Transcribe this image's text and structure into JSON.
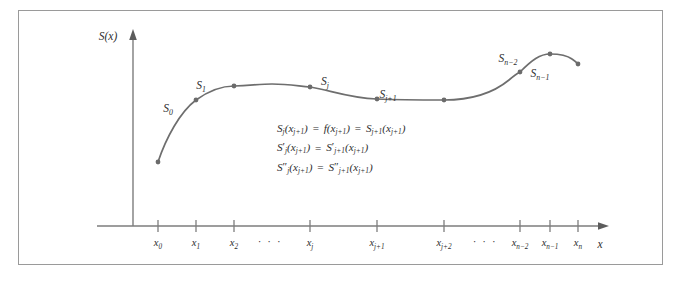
{
  "figure": {
    "kind": "cubic-spline-interpolation-diagram",
    "frame_color": "#9a9a9a",
    "curve_color": "#6e6e6e",
    "axis_color": "#7d7d7d",
    "text_color": "#2e2e2e",
    "background": "#ffffff"
  },
  "axes": {
    "y_label": "S(x)",
    "x_label": "x"
  },
  "x_ticks": [
    {
      "base": "x",
      "sub": "0",
      "x": 158
    },
    {
      "base": "x",
      "sub": "1",
      "x": 196
    },
    {
      "base": "x",
      "sub": "2",
      "x": 234
    },
    {
      "base": "x",
      "sub": "j",
      "x": 310
    },
    {
      "base": "x",
      "sub": "j+1",
      "x": 377
    },
    {
      "base": "x",
      "sub": "j+2",
      "x": 444
    },
    {
      "base": "x",
      "sub": "n−2",
      "x": 520
    },
    {
      "base": "x",
      "sub": "n−1",
      "x": 550
    },
    {
      "base": "x",
      "sub": "n",
      "x": 578
    }
  ],
  "x_ellipses": [
    {
      "text": "· · ·",
      "x": 270
    },
    {
      "text": "· · ·",
      "x": 485
    }
  ],
  "segment_labels": [
    {
      "base": "S",
      "sub": "0",
      "x": 168,
      "y": 112
    },
    {
      "base": "S",
      "sub": "1",
      "x": 201,
      "y": 89
    },
    {
      "base": "S",
      "sub": "j",
      "x": 325,
      "y": 85
    },
    {
      "base": "S",
      "sub": "j+1",
      "x": 388,
      "y": 98
    },
    {
      "base": "S",
      "sub": "n−2",
      "x": 508,
      "y": 62
    },
    {
      "base": "S",
      "sub": "n−1",
      "x": 540,
      "y": 77
    }
  ],
  "equations": [
    {
      "id": "continuity-value",
      "parts": [
        "S",
        "j",
        "(x",
        "j+1",
        ") ",
        "=",
        " f(x",
        "j+1",
        ")",
        " = ",
        "S",
        "j+1",
        "(x",
        "j+1",
        ")"
      ],
      "text": "S_j(x_{j+1}) = f(x_{j+1}) = S_{j+1}(x_{j+1})"
    },
    {
      "id": "continuity-first-derivative",
      "text": "S'_j(x_{j+1}) = S'_{j+1}(x_{j+1})"
    },
    {
      "id": "continuity-second-derivative",
      "text": "S''_j(x_{j+1}) = S''_{j+1}(x_{j+1})"
    }
  ],
  "knots": [
    {
      "x": 158,
      "y": 162
    },
    {
      "x": 196,
      "y": 100
    },
    {
      "x": 234,
      "y": 86
    },
    {
      "x": 310,
      "y": 87
    },
    {
      "x": 377,
      "y": 99
    },
    {
      "x": 444,
      "y": 100
    },
    {
      "x": 520,
      "y": 72
    },
    {
      "x": 550,
      "y": 54
    },
    {
      "x": 578,
      "y": 64
    }
  ],
  "curve_path": "M 158,162 C 166,138 180,112 196,100 C 210,90 224,86 234,86 C 254,85 262,84 272,84 C 288,84 298,86 310,87 C 330,90 348,98 377,99 C 400,100 422,100 444,100 C 470,100 492,94 509,80 C 516,74 520,72 520,72 C 532,60 540,54 550,54 C 560,54 568,56 572,59 C 575,61 577,63 578,64"
}
